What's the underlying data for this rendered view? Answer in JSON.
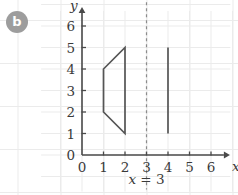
{
  "part": {
    "label": "b",
    "badge_color": "#9d9d9d",
    "badge_text_color": "#ffffff"
  },
  "chart_data": {
    "type": "scatter",
    "title": "",
    "xlabel": "x",
    "ylabel": "y",
    "xlim": [
      0,
      6.6
    ],
    "ylim": [
      0,
      6.6
    ],
    "xticks": [
      "0",
      "1",
      "2",
      "3",
      "4",
      "5",
      "6"
    ],
    "yticks": [
      "0",
      "1",
      "2",
      "3",
      "4",
      "5",
      "6"
    ],
    "grid": true,
    "grid_color": "#ebebeb",
    "axis_color": "#4a4a4a",
    "stroke_color": "#555555",
    "legend": "none",
    "annotations": [
      {
        "name": "mirror-line-label",
        "text_parts": {
          "variable": "x",
          "relation": " = ",
          "value": "3"
        },
        "text": "x = 3",
        "x": 3,
        "y": -1.35
      }
    ],
    "shapes": [
      {
        "name": "original-trapezoid",
        "kind": "polygon",
        "closed": true,
        "points": [
          [
            1,
            2
          ],
          [
            1,
            4
          ],
          [
            2,
            5
          ],
          [
            2,
            1
          ]
        ],
        "stroke": "#555555",
        "fill": "none"
      },
      {
        "name": "image-segment",
        "kind": "polyline",
        "closed": false,
        "points": [
          [
            4,
            1
          ],
          [
            4,
            5
          ]
        ],
        "stroke": "#555555",
        "fill": "none"
      },
      {
        "name": "mirror-line",
        "kind": "dashed-vertical",
        "x": 3,
        "y_from": -1.6,
        "y_to": 7.1,
        "stroke": "#8c8c8c",
        "dash": "3 3"
      }
    ]
  }
}
